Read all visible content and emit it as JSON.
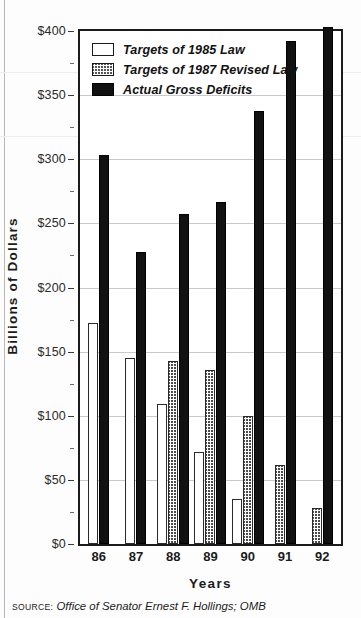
{
  "chart_data": {
    "type": "bar",
    "title": "",
    "xlabel": "Years",
    "ylabel": "Billions of Dollars",
    "categories": [
      "86",
      "87",
      "88",
      "89",
      "90",
      "91",
      "92"
    ],
    "ylim": [
      0,
      400
    ],
    "ytick_labels": [
      "$0",
      "$50",
      "$100",
      "$150",
      "$200",
      "$250",
      "$300",
      "$350",
      "$400"
    ],
    "ytick_values": [
      0,
      50,
      100,
      150,
      200,
      250,
      300,
      350,
      400
    ],
    "grid": true,
    "minor_ticks": true,
    "legend_position": "top-left",
    "series": [
      {
        "name": "Targets of 1985 Law",
        "style": "white",
        "values": [
          172,
          145,
          109,
          72,
          35,
          null,
          null
        ]
      },
      {
        "name": "Targets of 1987 Revised Law",
        "style": "hatched",
        "values": [
          null,
          null,
          143,
          136,
          100,
          62,
          28
        ]
      },
      {
        "name": "Actual Gross Deficits",
        "style": "black",
        "values": [
          303,
          228,
          257,
          267,
          338,
          392,
          403
        ]
      }
    ]
  },
  "legend": {
    "items": [
      {
        "label": "Targets of 1985 Law",
        "swatch": "white"
      },
      {
        "label": "Targets of 1987 Revised Law",
        "swatch": "hatched"
      },
      {
        "label": "Actual Gross Deficits",
        "swatch": "black"
      }
    ]
  },
  "axes": {
    "y_title": "Billions of Dollars",
    "x_title": "Years"
  },
  "source": {
    "kicker": "Source:",
    "text": "Office of Senator Ernest F. Hollings; OMB"
  },
  "colors": {
    "frame": "#1b1b1b",
    "gridline": "#c9c9c9",
    "bar_actual": "#111111",
    "bar_target85": "#ffffff",
    "bar_target87_hatch": "#4a4a4a",
    "text": "#1b1b1b",
    "page_background": "#fdfdfd"
  }
}
